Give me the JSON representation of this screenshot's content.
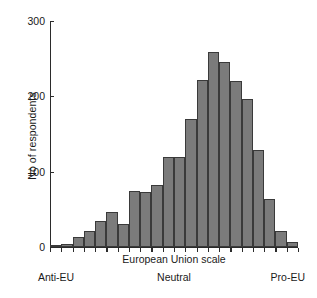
{
  "chart_data": {
    "type": "bar",
    "title": "",
    "subtitle": "",
    "xlabel": "European Union scale",
    "ylabel": "No of respondents",
    "ylim": [
      0,
      300
    ],
    "yticks": [
      0,
      100,
      200,
      300
    ],
    "ytick_labels": [
      "0",
      "100",
      "200",
      "300"
    ],
    "grid": false,
    "legend": "none",
    "bar_color": "#7b7b7b",
    "bar_edge_color": "#3a3a3a",
    "axis_color": "#2b2b2b",
    "categories": [
      "1",
      "2",
      "3",
      "4",
      "5",
      "6",
      "7",
      "8",
      "9",
      "10",
      "11",
      "12",
      "13",
      "14",
      "15",
      "16",
      "17",
      "18",
      "19",
      "20",
      "21",
      "22"
    ],
    "values": [
      3,
      4,
      13,
      21,
      35,
      47,
      31,
      75,
      73,
      82,
      120,
      119,
      170,
      222,
      259,
      246,
      221,
      196,
      129,
      64,
      21,
      7
    ],
    "x_scale_anchors": [
      {
        "position": "left",
        "label": "Anti-EU"
      },
      {
        "position": "center",
        "label": "Neutral"
      },
      {
        "position": "right",
        "label": "Pro-EU"
      }
    ]
  },
  "axes": {
    "y_title": "No of respondents",
    "x_title": "European Union scale",
    "y_tick_labels": [
      "300",
      "200",
      "100",
      "0"
    ]
  },
  "scale_labels": {
    "left": "Anti-EU",
    "middle": "Neutral",
    "right": "Pro-EU"
  }
}
